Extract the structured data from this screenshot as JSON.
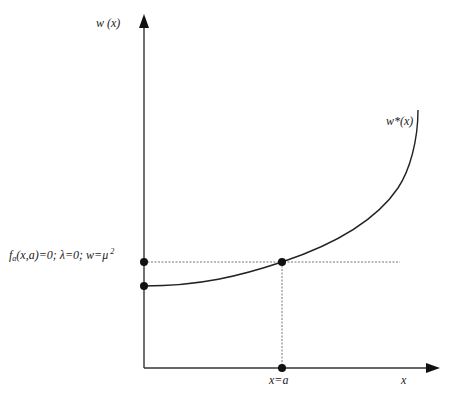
{
  "diagram": {
    "y_axis_label": "w (x)",
    "x_axis_label": "x",
    "curve_label": "w*(x)",
    "x_marker_label": "x=a",
    "condition_label": {
      "f": "f",
      "sub": "a",
      "rest": "(x,a)=0; λ=0; w=μ",
      "sup": "2"
    },
    "colors": {
      "axis": "#333333",
      "curve": "#222222",
      "dashed": "#555555",
      "points": "#111111"
    },
    "points": [
      {
        "name": "intercept-upper",
        "x": 144,
        "y": 262
      },
      {
        "name": "intercept-lower",
        "x": 144,
        "y": 286
      },
      {
        "name": "intersection",
        "x": 282,
        "y": 262
      },
      {
        "name": "x-axis-a",
        "x": 282,
        "y": 368
      }
    ]
  }
}
